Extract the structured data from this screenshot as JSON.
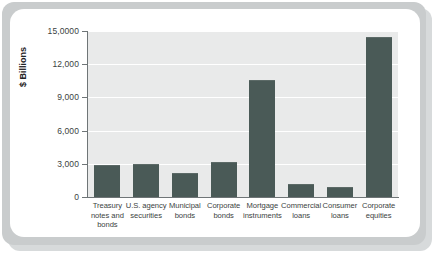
{
  "chart_data": {
    "type": "bar",
    "title": "",
    "subtitle": "",
    "xlabel": "",
    "ylabel": "$ Billions",
    "ylim": [
      0,
      15000
    ],
    "grid": true,
    "legend": "none",
    "ytick_labels": [
      "15,0000",
      "12,000",
      "9,000",
      "6,000",
      "3,000",
      "0"
    ],
    "ytick_values": [
      15000,
      12000,
      9000,
      6000,
      3000,
      0
    ],
    "categories": [
      "Treasury notes and bonds",
      "U.S. agency securities",
      "Municipal bonds",
      "Corporate bonds",
      "Mortgage instruments",
      "Commercial loans",
      "Consumer loans",
      "Corporate equities"
    ],
    "category_lines": [
      [
        "Treasury",
        "notes and",
        "bonds"
      ],
      [
        "U.S. agency",
        "securities"
      ],
      [
        "Municipal",
        "bonds"
      ],
      [
        "Corporate",
        "bonds"
      ],
      [
        "Mortgage",
        "instruments"
      ],
      [
        "Commercial",
        "loans"
      ],
      [
        "Consumer",
        "loans"
      ],
      [
        "Corporate",
        "equities"
      ]
    ],
    "values": [
      2800,
      2900,
      2100,
      3050,
      10500,
      1050,
      800,
      14400
    ],
    "bar_color": "#4a5a57",
    "plot_background": "#e9eaea",
    "gridline_color": "#ffffff",
    "axis_color": "#6f7577",
    "card_background": "#ffffff",
    "page_background": "#c9cccd"
  }
}
